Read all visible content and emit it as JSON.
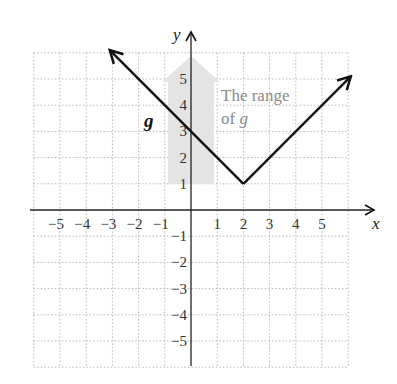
{
  "chart_data": {
    "type": "line",
    "title": "",
    "xlabel": "x",
    "ylabel": "y",
    "xlim": [
      -6,
      6
    ],
    "ylim": [
      -6,
      6
    ],
    "grid": true,
    "x_ticks": [
      "−5",
      "−4",
      "−3",
      "−2",
      "−1",
      "1",
      "2",
      "3",
      "4",
      "5"
    ],
    "y_ticks": [
      "5",
      "4",
      "3",
      "2",
      "1",
      "−1",
      "−2",
      "−3",
      "−4",
      "−5"
    ],
    "series": [
      {
        "name": "g",
        "equation": "g(x) = |x − 2| + 1",
        "points": [
          [
            -3.1,
            6.1
          ],
          [
            0,
            3
          ],
          [
            2,
            1
          ],
          [
            6.1,
            5.1
          ]
        ],
        "vertex": [
          2,
          1
        ],
        "y_intercept": 3,
        "color": "#111111"
      }
    ],
    "annotations": {
      "function_label": "g",
      "range_label_line1": "The range",
      "range_label_line2_prefix": "of ",
      "range_label_line2_var": "g",
      "range_shading": "from y = 1 upward (arrow)",
      "range_color": "#e3e3e3"
    }
  }
}
